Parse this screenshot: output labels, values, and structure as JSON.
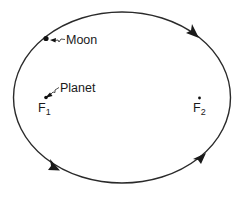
{
  "diagram": {
    "type": "elliptical-orbit",
    "colors": {
      "stroke": "#2a2a2a",
      "text": "#1a1a1a",
      "background": "#ffffff"
    },
    "orbit": {
      "cx": 122,
      "cy": 97.5,
      "rx": 108.5,
      "ry": 85.5,
      "direction": "counter-clockwise-visual"
    },
    "labels": {
      "moon": "Moon",
      "planet": "Planet",
      "focus1": "F",
      "focus1_sub": "1",
      "focus2": "F",
      "focus2_sub": "2"
    },
    "points": {
      "moon": {
        "x": 46,
        "y": 38
      },
      "planet": {
        "x": 46,
        "y": 97
      },
      "focus2": {
        "x": 199,
        "y": 98
      }
    },
    "arrows": [
      {
        "name": "top-right",
        "x": 197,
        "y": 36
      },
      {
        "name": "bottom-left",
        "x": 59,
        "y": 170
      },
      {
        "name": "bottom-right",
        "x": 201,
        "y": 158
      }
    ]
  }
}
